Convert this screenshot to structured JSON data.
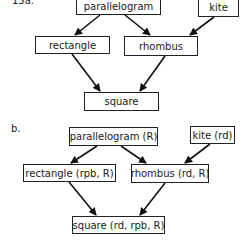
{
  "part_a": {
    "label": "15a.",
    "nodes": {
      "parallelogram": "parallelogram",
      "kite": "kite",
      "rectangle": "rectangle",
      "rhombus": "rhombus",
      "square": "square"
    },
    "edges": [
      [
        "parallelogram",
        "rectangle"
      ],
      [
        "parallelogram",
        "rhombus"
      ],
      [
        "kite",
        "rhombus"
      ],
      [
        "rectangle",
        "square"
      ],
      [
        "rhombus",
        "square"
      ]
    ]
  },
  "part_b": {
    "label": "b.",
    "nodes": {
      "parallelogram": "parallelogram (R)",
      "kite": "kite (rd)",
      "rectangle": "rectangle (rpb, R)",
      "rhombus": "rhombus (rd, R)",
      "square": "square (rd, rpb, R)"
    },
    "edges": [
      [
        "parallelogram",
        "rectangle"
      ],
      [
        "parallelogram",
        "rhombus"
      ],
      [
        "kite",
        "rhombus"
      ],
      [
        "rectangle",
        "square"
      ],
      [
        "rhombus",
        "square"
      ]
    ]
  }
}
